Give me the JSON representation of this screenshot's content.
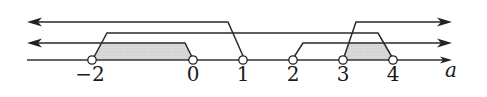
{
  "diagram": {
    "type": "number-line-intervals",
    "axis": {
      "label": "a",
      "y": 60,
      "x_start": 27,
      "x_end": 452,
      "color": "#333333"
    },
    "ticks": [
      {
        "value": -2,
        "label": "−2",
        "x": 92
      },
      {
        "value": 0,
        "label": "0",
        "x": 193
      },
      {
        "value": 1,
        "label": "1",
        "x": 243
      },
      {
        "value": 2,
        "label": "2",
        "x": 293
      },
      {
        "value": 3,
        "label": "3",
        "x": 343
      },
      {
        "value": 4,
        "label": "4",
        "x": 393
      }
    ],
    "open_points": [
      -2,
      0,
      1,
      2,
      3,
      4
    ],
    "intervals": [
      {
        "name": "a-less-than-1",
        "description": "a < 1",
        "level_y": 22,
        "direction": "left",
        "endpoint": 1
      },
      {
        "name": "a-between-neg2-and-4",
        "description": "-2 < a < 4",
        "level_y": 33,
        "from": -2,
        "to": 4
      },
      {
        "name": "a-less-than-0",
        "description": "a < 0",
        "level_y": 43,
        "direction": "left",
        "endpoint": 0
      },
      {
        "name": "a-greater-than-2",
        "description": "a > 2",
        "level_y": 43,
        "direction": "right",
        "endpoint": 2
      },
      {
        "name": "a-greater-than-3",
        "description": "a > 3",
        "level_y": 22,
        "direction": "right",
        "endpoint": 3
      }
    ],
    "shaded_regions": [
      {
        "from": -2,
        "to": 0,
        "color": "#d4d4d4"
      },
      {
        "from": 3,
        "to": 4,
        "color": "#d4d4d4"
      }
    ],
    "line_color": "#2a2a2a"
  }
}
